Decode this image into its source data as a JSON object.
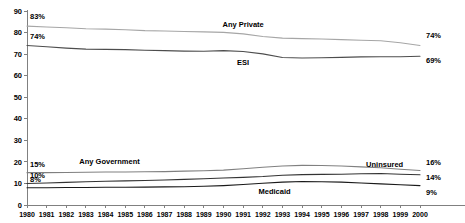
{
  "chart_data": {
    "type": "line",
    "title": "",
    "xlabel": "",
    "ylabel": "",
    "ylim": [
      0,
      90
    ],
    "ytick_step": 10,
    "grid": false,
    "legend_position": "inline-annotations",
    "x": [
      1980,
      1981,
      1982,
      1983,
      1984,
      1985,
      1986,
      1987,
      1988,
      1989,
      1990,
      1991,
      1992,
      1993,
      1994,
      1995,
      1996,
      1997,
      1998,
      1999,
      2000
    ],
    "yticks": [
      0,
      10,
      20,
      30,
      40,
      50,
      60,
      70,
      80,
      90
    ],
    "series": [
      {
        "name": "Any Private",
        "color": "#a6a6a6",
        "start_label": "83%",
        "end_label": "74%",
        "values": [
          83,
          82.6,
          82.2,
          81.8,
          81.6,
          81.3,
          80.9,
          80.7,
          80.5,
          80.3,
          80.1,
          79.4,
          78.2,
          77.4,
          77.2,
          77.0,
          76.7,
          76.4,
          76.2,
          75.3,
          74
        ]
      },
      {
        "name": "ESI",
        "color": "#4d4d4d",
        "start_label": "74%",
        "end_label": "69%",
        "values": [
          74,
          73.4,
          72.8,
          72.3,
          72.2,
          72.1,
          71.8,
          71.6,
          71.4,
          71.3,
          71.6,
          71.2,
          70.1,
          68.4,
          68.2,
          68.3,
          68.5,
          68.7,
          68.8,
          68.8,
          69
        ]
      },
      {
        "name": "Any Government",
        "color": "#808080",
        "start_label": "15%",
        "end_label": "16%",
        "values": [
          15,
          15.0,
          15.1,
          15.2,
          15.3,
          15.3,
          15.4,
          15.5,
          15.7,
          15.9,
          16.2,
          16.8,
          17.5,
          18.1,
          18.4,
          18.3,
          18.1,
          17.7,
          17.3,
          16.6,
          16
        ]
      },
      {
        "name": "Uninsured",
        "color": "#333333",
        "start_label": "10%",
        "end_label": "14%",
        "values": [
          10,
          10.2,
          10.5,
          10.8,
          11.0,
          11.2,
          11.4,
          11.6,
          11.9,
          12.2,
          12.5,
          12.8,
          13.2,
          13.8,
          14.1,
          14.2,
          14.3,
          14.5,
          14.6,
          14.3,
          14
        ]
      },
      {
        "name": "Medicaid",
        "color": "#1a1a1a",
        "start_label": "8%",
        "end_label": "9%",
        "values": [
          8,
          8.0,
          8.1,
          8.1,
          8.2,
          8.2,
          8.3,
          8.4,
          8.5,
          8.7,
          9.0,
          9.5,
          10.1,
          10.6,
          10.9,
          10.8,
          10.6,
          10.2,
          9.8,
          9.4,
          9
        ]
      }
    ],
    "annotations": [
      {
        "text": "Any Private",
        "series": "Any Private"
      },
      {
        "text": "ESI",
        "series": "ESI"
      },
      {
        "text": "Any Government",
        "series": "Any Government"
      },
      {
        "text": "Uninsured",
        "series": "Uninsured"
      },
      {
        "text": "Medicaid",
        "series": "Medicaid"
      }
    ]
  }
}
